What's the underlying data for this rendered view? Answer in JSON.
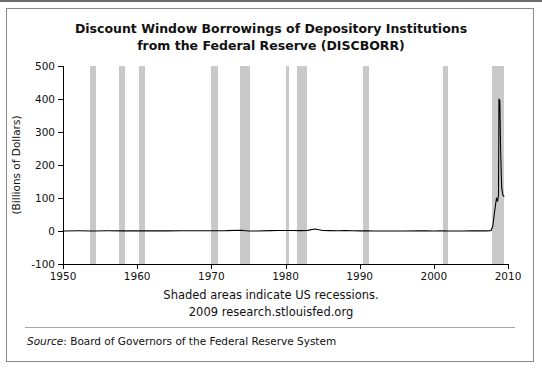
{
  "chart_data": {
    "type": "line",
    "title": "Discount Window Borrowings of Depository Institutions",
    "title_line2": "from the Federal Reserve (DISCBORR)",
    "ylabel": "(Billions of Dollars)",
    "xlabel": "",
    "ylim": [
      -100,
      500
    ],
    "xlim": [
      1950,
      2010
    ],
    "yticks": [
      -100,
      0,
      100,
      200,
      300,
      400,
      500
    ],
    "ytick_labels": [
      "-100",
      "0",
      "100",
      "200",
      "300",
      "400",
      "500"
    ],
    "xticks": [
      1950,
      1960,
      1970,
      1980,
      1990,
      2000,
      2010
    ],
    "xtick_labels": [
      "1950",
      "1960",
      "1970",
      "1980",
      "1990",
      "2000",
      "2010"
    ],
    "grid": false,
    "legend": "none",
    "line_color": "#000000",
    "recession_color": "#c9c9c9",
    "recession_bands": [
      {
        "start": 1953.6,
        "end": 1954.4
      },
      {
        "start": 1957.6,
        "end": 1958.3
      },
      {
        "start": 1960.3,
        "end": 1961.1
      },
      {
        "start": 1969.9,
        "end": 1970.9
      },
      {
        "start": 1973.9,
        "end": 1975.2
      },
      {
        "start": 1980.0,
        "end": 1980.5
      },
      {
        "start": 1981.5,
        "end": 1982.9
      },
      {
        "start": 1990.5,
        "end": 1991.2
      },
      {
        "start": 2001.2,
        "end": 2001.9
      },
      {
        "start": 2007.9,
        "end": 2009.5
      }
    ],
    "series": [
      {
        "name": "DISCBORR",
        "points": [
          [
            1950,
            0.1
          ],
          [
            1952,
            0.6
          ],
          [
            1954,
            0.2
          ],
          [
            1956,
            0.8
          ],
          [
            1958,
            0.5
          ],
          [
            1960,
            0.4
          ],
          [
            1962,
            0.3
          ],
          [
            1964,
            0.3
          ],
          [
            1966,
            0.7
          ],
          [
            1968,
            0.7
          ],
          [
            1970,
            0.8
          ],
          [
            1972,
            1.0
          ],
          [
            1974,
            2.5
          ],
          [
            1975,
            0.2
          ],
          [
            1976,
            0.1
          ],
          [
            1978,
            1.2
          ],
          [
            1979,
            1.5
          ],
          [
            1980,
            1.6
          ],
          [
            1981,
            1.6
          ],
          [
            1982,
            1.2
          ],
          [
            1983,
            2.0
          ],
          [
            1984,
            6.0
          ],
          [
            1985,
            1.5
          ],
          [
            1986,
            1.0
          ],
          [
            1987,
            0.8
          ],
          [
            1988,
            1.6
          ],
          [
            1989,
            0.6
          ],
          [
            1990,
            0.5
          ],
          [
            1991,
            0.3
          ],
          [
            1992,
            0.2
          ],
          [
            1994,
            0.2
          ],
          [
            1996,
            0.1
          ],
          [
            1998,
            0.4
          ],
          [
            1999,
            0.3
          ],
          [
            2000,
            0.2
          ],
          [
            2001,
            0.5
          ],
          [
            2002,
            0.1
          ],
          [
            2003,
            0.1
          ],
          [
            2004,
            0.2
          ],
          [
            2005,
            0.3
          ],
          [
            2006,
            0.3
          ],
          [
            2007.0,
            0.3
          ],
          [
            2007.7,
            1.0
          ],
          [
            2007.95,
            15.0
          ],
          [
            2008.2,
            60.0
          ],
          [
            2008.45,
            100.0
          ],
          [
            2008.6,
            90.0
          ],
          [
            2008.72,
            110.0
          ],
          [
            2008.78,
            400.0
          ],
          [
            2008.9,
            395.0
          ],
          [
            2009.0,
            250.0
          ],
          [
            2009.15,
            130.0
          ],
          [
            2009.3,
            110.0
          ],
          [
            2009.45,
            105.0
          ]
        ]
      }
    ]
  },
  "captions": {
    "recession_note": "Shaded areas indicate US recessions.",
    "attribution": "2009 research.stlouisfed.org"
  },
  "source": {
    "label": "Source",
    "text": ": Board of Governors of the Federal Reserve System"
  }
}
